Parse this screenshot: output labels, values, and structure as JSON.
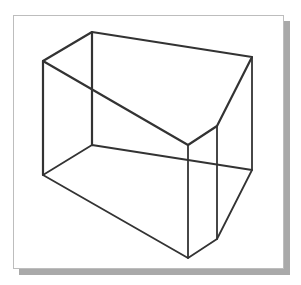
{
  "figure": {
    "frame_color": "#bdbdbd",
    "shadow_color": "#a9a9a9",
    "line_color": "#333333",
    "vertices": {
      "top_back_left": [
        92,
        32
      ],
      "top_left": [
        43,
        61
      ],
      "top_right": [
        252,
        57
      ],
      "top_bevel": [
        217,
        126
      ],
      "top_front": [
        188,
        145
      ],
      "bottom_back_left": [
        92,
        145
      ],
      "bottom_left": [
        43,
        175
      ],
      "bottom_right": [
        252,
        170
      ],
      "bottom_bevel": [
        217,
        239
      ],
      "bottom_front": [
        188,
        258
      ]
    }
  }
}
